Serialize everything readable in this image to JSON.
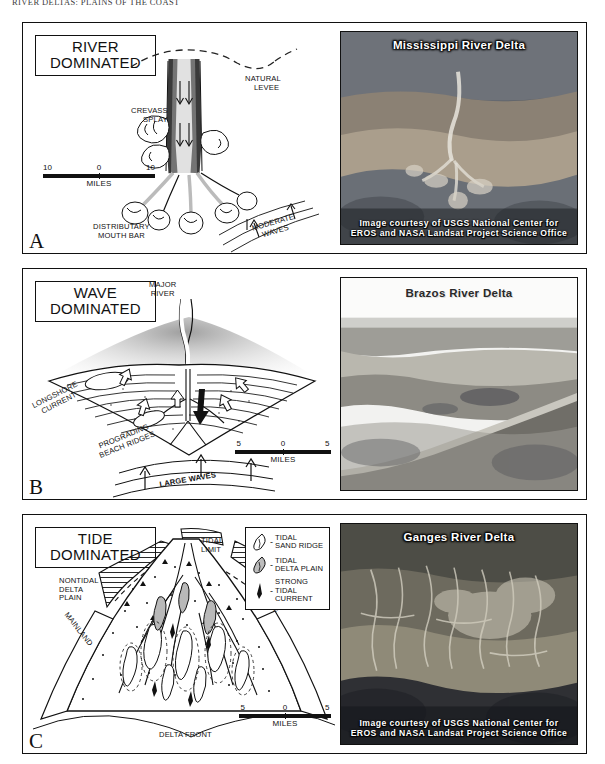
{
  "running_head": "RIVER DELTAS: PLAINS OF THE COAST",
  "panels": [
    {
      "letter": "A",
      "title_line1": "RIVER",
      "title_line2": "DOMINATED",
      "labels": {
        "crevasse": [
          "CREVASS",
          "SPLAY"
        ],
        "levee": [
          "NATURAL",
          "LEVEE"
        ],
        "mouth_bar": [
          "DISTRIBUTARY",
          "MOUTH BAR"
        ],
        "waves": [
          "MODERATE",
          "WAVES"
        ]
      },
      "scale": {
        "left": "10",
        "center": "0",
        "right": "10",
        "units": "MILES"
      },
      "photo": {
        "title": "Mississippi River Delta",
        "title_style": "light",
        "credit_line1": "Image courtesy of USGS National Center for",
        "credit_line2": "EROS and NASA Landsat Project Science Office",
        "has_credit": true
      }
    },
    {
      "letter": "B",
      "title_line1": "WAVE",
      "title_line2": "DOMINATED",
      "labels": {
        "major_river": [
          "MAJOR",
          "RIVER"
        ],
        "longshore": [
          "LONGSHORE",
          "CURRENT"
        ],
        "beach_ridges": [
          "PROGRADING",
          "BEACH RIDGES"
        ],
        "waves": [
          "LARGE  WAVES"
        ]
      },
      "scale": {
        "left": "5",
        "center": "0",
        "right": "5",
        "units": "MILES"
      },
      "photo": {
        "title": "Brazos River Delta",
        "title_style": "dark",
        "credit_line1": "",
        "credit_line2": "",
        "has_credit": false
      }
    },
    {
      "letter": "C",
      "title_line1": "TIDE",
      "title_line2": "DOMINATED",
      "labels": {
        "tidal_limit": [
          "TIDAL",
          "LIMIT"
        ],
        "nontidal": [
          "NONTIDAL",
          "DELTA",
          "PLAIN"
        ],
        "mainland_left": "MAINLAND",
        "mainland_right": "MAINLAND",
        "delta_front": [
          "DELTA FRONT"
        ]
      },
      "legend": [
        {
          "symbol": "tidal-sand-ridge",
          "line1": "TIDAL",
          "line2": "SAND RIDGE"
        },
        {
          "symbol": "tidal-delta-plain",
          "line1": "TIDAL",
          "line2": "DELTA PLAIN"
        },
        {
          "symbol": "strong-tidal-current",
          "line1": "STRONG",
          "line2": "TIDAL",
          "line3": "CURRENT"
        }
      ],
      "scale": {
        "left": "5",
        "center": "0",
        "right": "5",
        "units": "MILES"
      },
      "photo": {
        "title": "Ganges River Delta",
        "title_style": "light",
        "credit_line1": "Image courtesy of USGS National Center for",
        "credit_line2": "EROS and NASA Landsat Project Science Office",
        "has_credit": true
      }
    }
  ],
  "colors": {
    "ink": "#111111",
    "paper": "#ffffff",
    "photo_dark": "#2d2a26",
    "photo_mid": "#8a8276"
  }
}
